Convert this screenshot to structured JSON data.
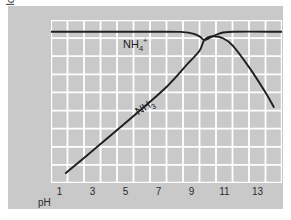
{
  "chart_data": {
    "type": "line",
    "title": "",
    "xlabel": "pH",
    "ylabel": "log10-Concentration",
    "ylabel_base": "log",
    "ylabel_sub": "10",
    "ylabel_tail": "-Concentration",
    "xlim": [
      0,
      14
    ],
    "ylim": [
      0,
      9
    ],
    "xticks": [
      1,
      3,
      5,
      7,
      9,
      11,
      13
    ],
    "xtick_labels": [
      "1",
      "3",
      "5",
      "7",
      "9",
      "11",
      "13"
    ],
    "ytick_labels": [],
    "grid": true,
    "grid_color": "#ffffff",
    "plot_bg": "#c9c9c9",
    "legend": "inline-labels",
    "line_color": "#1f1f1f",
    "series": [
      {
        "name": "NH4+",
        "label_html": "NH<sub>4</sub><sup>+</sup>",
        "label_text": "NH4+",
        "x": [
          0.0,
          7.0,
          8.0,
          8.6,
          9.0,
          9.3,
          9.7,
          10.2,
          11.0,
          14.0
        ],
        "y": [
          8.35,
          8.35,
          8.33,
          8.25,
          8.1,
          7.9,
          8.05,
          8.25,
          8.35,
          8.35
        ]
      },
      {
        "name": "NH3",
        "label_html": "NH<sub>3</sub>",
        "label_text": "NH3",
        "x": [
          0.9,
          3.0,
          5.0,
          7.0,
          8.3,
          9.0,
          9.3,
          9.8,
          10.4,
          11.0,
          12.0,
          13.0,
          13.5
        ],
        "y": [
          0.55,
          2.15,
          3.7,
          5.3,
          6.6,
          7.3,
          7.9,
          8.1,
          8.0,
          7.6,
          6.4,
          5.0,
          4.2
        ]
      }
    ],
    "crossover": {
      "ph": 9.3,
      "label": ""
    }
  }
}
